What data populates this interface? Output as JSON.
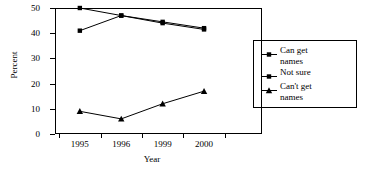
{
  "chart_data": {
    "type": "line",
    "title": "",
    "xlabel": "Year",
    "ylabel": "Percent",
    "x": [
      "1995",
      "1996",
      "1999",
      "2000"
    ],
    "categories": [
      "1995",
      "1996",
      "1999",
      "2000"
    ],
    "ylim": [
      0,
      50
    ],
    "yticks": [
      0,
      10,
      20,
      30,
      40,
      50
    ],
    "ytick_labels": [
      "0",
      "10",
      "20",
      "30",
      "40",
      "50"
    ],
    "grid": false,
    "legend_position": "right-inside",
    "series": [
      {
        "name": "Can get names",
        "marker": "square",
        "values": [
          50,
          47,
          44.5,
          42
        ]
      },
      {
        "name": "Not sure",
        "marker": "square",
        "values": [
          41,
          47,
          44,
          41.5
        ]
      },
      {
        "name": "Can't get names",
        "marker": "triangle",
        "values": [
          9,
          6,
          12,
          17
        ]
      }
    ],
    "colors": {
      "line": "#000000",
      "marker": "#000000",
      "axis": "#000000",
      "background": "#ffffff"
    }
  },
  "legend": {
    "entries": [
      {
        "label": "Can get\nnames",
        "marker": "square"
      },
      {
        "label": "Not sure",
        "marker": "square"
      },
      {
        "label": "Can't get\nnames",
        "marker": "triangle"
      }
    ]
  }
}
